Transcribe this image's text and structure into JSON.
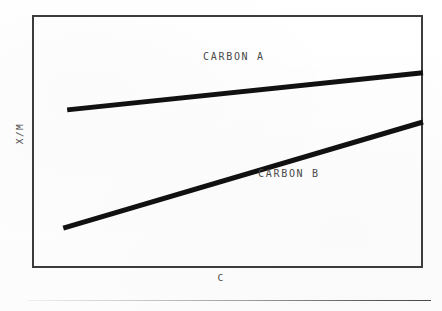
{
  "figure": {
    "background_color": "#fdfdfd",
    "frame_color": "#3c3c3c",
    "line_color": "#111111",
    "text_color": "#4a4a4a"
  },
  "axes": {
    "x_label": "C",
    "y_label": "X/M"
  },
  "labels": {
    "carbon_a": "CARBON A",
    "carbon_b": "CARBON B"
  },
  "chart_data": {
    "type": "line",
    "title": "",
    "subtitle": "",
    "xlabel": "C",
    "ylabel": "X/M",
    "xlim": [
      0,
      1
    ],
    "ylim": [
      0,
      1
    ],
    "grid": false,
    "legend": "inline-annotations",
    "tick_labels": {
      "x": [],
      "y": []
    },
    "annotations": [
      {
        "text": "CARBON A",
        "x": 0.45,
        "y": 0.86
      },
      {
        "text": "CARBON B",
        "x": 0.6,
        "y": 0.4
      }
    ],
    "series": [
      {
        "name": "CARBON A",
        "x": [
          0.09,
          1.0
        ],
        "y": [
          0.625,
          0.772
        ],
        "style": "solid",
        "linewidth": 5,
        "color": "#111111"
      },
      {
        "name": "CARBON B",
        "x": [
          0.08,
          1.0
        ],
        "y": [
          0.158,
          0.577
        ],
        "style": "solid",
        "linewidth": 5,
        "color": "#111111"
      }
    ]
  }
}
